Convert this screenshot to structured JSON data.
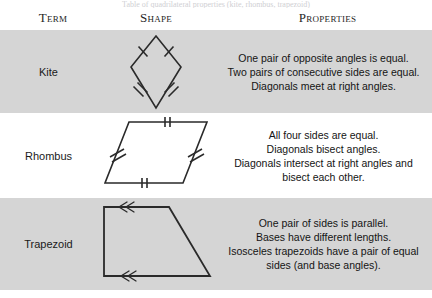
{
  "caption": "Table of quadrilateral properties (kite, rhombus, trapezoid)",
  "header": {
    "term_label": "Term",
    "shape_label": "Shape",
    "properties_label": "Properties"
  },
  "colors": {
    "shaded_row": "#d5d5d5",
    "plain_row": "#ffffff",
    "text": "#1a1a1a",
    "stroke": "#2a2a2a"
  },
  "rows": [
    {
      "term": "Kite",
      "shape_name": "kite-diagram",
      "shading": "shaded",
      "properties": [
        "One pair of opposite angles is equal.",
        "Two pairs of consecutive sides are equal.",
        "Diagonals meet at right angles."
      ]
    },
    {
      "term": "Rhombus",
      "shape_name": "rhombus-diagram",
      "shading": "plain",
      "properties": [
        "All four sides are equal.",
        "Diagonals bisect angles.",
        "Diagonals intersect at right angles and bisect each other."
      ]
    },
    {
      "term": "Trapezoid",
      "shape_name": "trapezoid-diagram",
      "shading": "shaded",
      "properties": [
        "One pair of sides is parallel.",
        "Bases have different lengths.",
        "Isosceles trapezoids have a pair of equal sides (and base angles)."
      ]
    }
  ]
}
